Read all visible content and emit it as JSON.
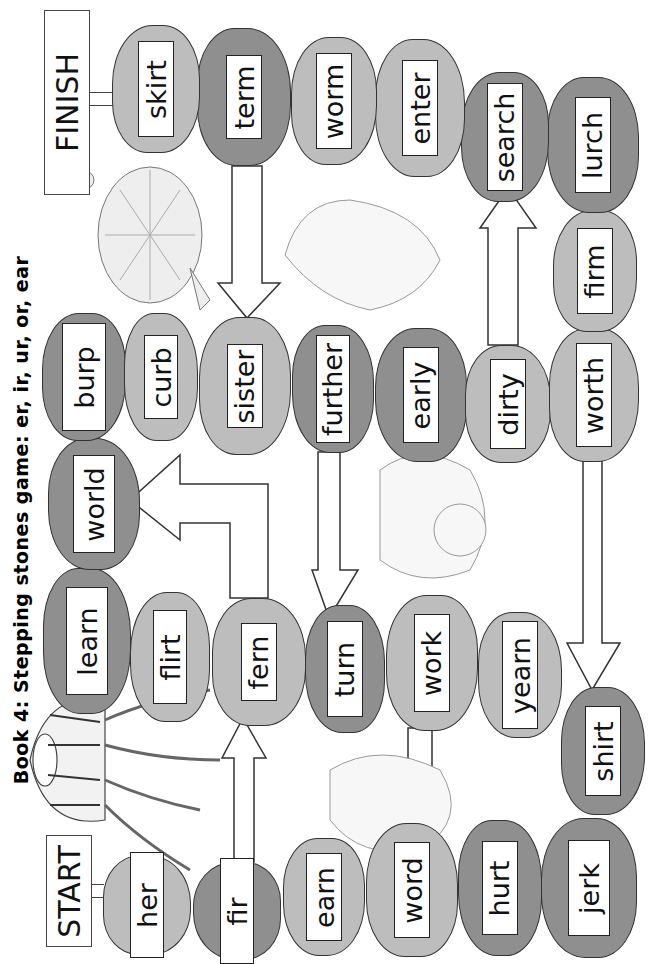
{
  "title": "Book 4:  Stepping stones game: er, ir, ur, or, ear",
  "board": {
    "start_label": "START",
    "finish_label": "FINISH",
    "stones": [
      {
        "word": "her",
        "shade": "light"
      },
      {
        "word": "fir",
        "shade": "dark"
      },
      {
        "word": "fern",
        "shade": "light"
      },
      {
        "word": "flirt",
        "shade": "light"
      },
      {
        "word": "learn",
        "shade": "dark"
      },
      {
        "word": "world",
        "shade": "dark"
      },
      {
        "word": "burp",
        "shade": "dark"
      },
      {
        "word": "curb",
        "shade": "light"
      },
      {
        "word": "sister",
        "shade": "light"
      },
      {
        "word": "further",
        "shade": "dark"
      },
      {
        "word": "early",
        "shade": "dark"
      },
      {
        "word": "dirty",
        "shade": "light"
      },
      {
        "word": "worth",
        "shade": "light"
      },
      {
        "word": "firm",
        "shade": "light"
      },
      {
        "word": "lurch",
        "shade": "dark"
      },
      {
        "word": "search",
        "shade": "dark"
      },
      {
        "word": "enter",
        "shade": "light"
      },
      {
        "word": "worm",
        "shade": "light"
      },
      {
        "word": "term",
        "shade": "dark"
      },
      {
        "word": "skirt",
        "shade": "light"
      },
      {
        "word": "turn",
        "shade": "dark"
      },
      {
        "word": "work",
        "shade": "light"
      },
      {
        "word": "yearn",
        "shade": "light"
      },
      {
        "word": "shirt",
        "shade": "dark"
      },
      {
        "word": "jerk",
        "shade": "dark"
      },
      {
        "word": "hurt",
        "shade": "dark"
      },
      {
        "word": "word",
        "shade": "light"
      },
      {
        "word": "earn",
        "shade": "light"
      }
    ]
  },
  "illustrations": [
    "jellyfish",
    "turtle",
    "fairy-top",
    "fairy-middle",
    "fairy-bottom"
  ],
  "colors": {
    "dark_stone": "#8f8f8f",
    "light_stone": "#bdbdbd",
    "label_bg": "#ffffff",
    "outline": "#333333"
  }
}
